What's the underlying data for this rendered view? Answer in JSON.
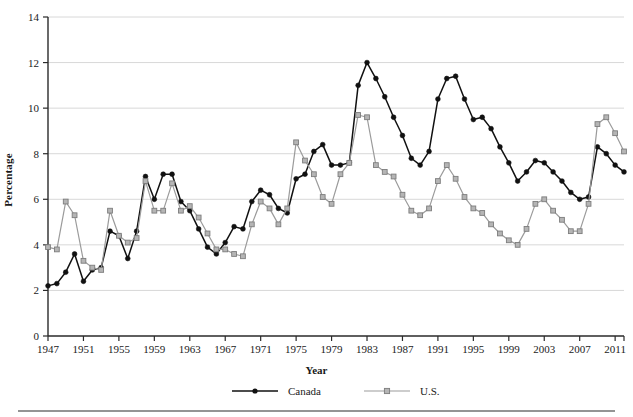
{
  "chart_data": {
    "type": "line",
    "title": "",
    "xlabel": "Year",
    "ylabel": "Percentage",
    "xlim": [
      1947,
      2012
    ],
    "ylim": [
      0,
      14
    ],
    "ytick_step": 2,
    "xtick_step": 4,
    "grid": "horizontal",
    "legend_position": "bottom-center",
    "yticks": [
      "0",
      "2",
      "4",
      "6",
      "8",
      "10",
      "12",
      "14"
    ],
    "xticks": [
      "1947",
      "1951",
      "1955",
      "1959",
      "1963",
      "1967",
      "1971",
      "1975",
      "1979",
      "1983",
      "1987",
      "1991",
      "1995",
      "1999",
      "2003",
      "2007",
      "2011"
    ],
    "x": [
      1947,
      1948,
      1949,
      1950,
      1951,
      1952,
      1953,
      1954,
      1955,
      1956,
      1957,
      1958,
      1959,
      1960,
      1961,
      1962,
      1963,
      1964,
      1965,
      1966,
      1967,
      1968,
      1969,
      1970,
      1971,
      1972,
      1973,
      1974,
      1975,
      1976,
      1977,
      1978,
      1979,
      1980,
      1981,
      1982,
      1983,
      1984,
      1985,
      1986,
      1987,
      1988,
      1989,
      1990,
      1991,
      1992,
      1993,
      1994,
      1995,
      1996,
      1997,
      1998,
      1999,
      2000,
      2001,
      2002,
      2003,
      2004,
      2005,
      2006,
      2007,
      2008,
      2009,
      2010,
      2011,
      2012
    ],
    "series": [
      {
        "name": "Canada",
        "color": "#111111",
        "marker": "circle",
        "values": [
          2.2,
          2.3,
          2.8,
          3.6,
          2.4,
          2.9,
          3.0,
          4.6,
          4.4,
          3.4,
          4.6,
          7.0,
          6.0,
          7.1,
          7.1,
          5.9,
          5.5,
          4.7,
          3.9,
          3.6,
          4.1,
          4.8,
          4.7,
          5.9,
          6.4,
          6.2,
          5.6,
          5.4,
          6.9,
          7.1,
          8.1,
          8.4,
          7.5,
          7.5,
          7.6,
          11.0,
          12.0,
          11.3,
          10.5,
          9.6,
          8.8,
          7.8,
          7.5,
          8.1,
          10.4,
          11.3,
          11.4,
          10.4,
          9.5,
          9.6,
          9.1,
          8.3,
          7.6,
          6.8,
          7.2,
          7.7,
          7.6,
          7.2,
          6.8,
          6.3,
          6.0,
          6.1,
          8.3,
          8.0,
          7.5,
          7.2
        ]
      },
      {
        "name": "U.S.",
        "color": "#9b9b9b",
        "marker": "square",
        "values": [
          3.9,
          3.8,
          5.9,
          5.3,
          3.3,
          3.0,
          2.9,
          5.5,
          4.4,
          4.1,
          4.3,
          6.8,
          5.5,
          5.5,
          6.7,
          5.5,
          5.7,
          5.2,
          4.5,
          3.8,
          3.8,
          3.6,
          3.5,
          4.9,
          5.9,
          5.6,
          4.9,
          5.6,
          8.5,
          7.7,
          7.1,
          6.1,
          5.8,
          7.1,
          7.6,
          9.7,
          9.6,
          7.5,
          7.2,
          7.0,
          6.2,
          5.5,
          5.3,
          5.6,
          6.8,
          7.5,
          6.9,
          6.1,
          5.6,
          5.4,
          4.9,
          4.5,
          4.2,
          4.0,
          4.7,
          5.8,
          6.0,
          5.5,
          5.1,
          4.6,
          4.6,
          5.8,
          9.3,
          9.6,
          8.9,
          8.1
        ]
      }
    ]
  },
  "legend": {
    "items": [
      {
        "label": "Canada"
      },
      {
        "label": "U.S."
      }
    ]
  }
}
